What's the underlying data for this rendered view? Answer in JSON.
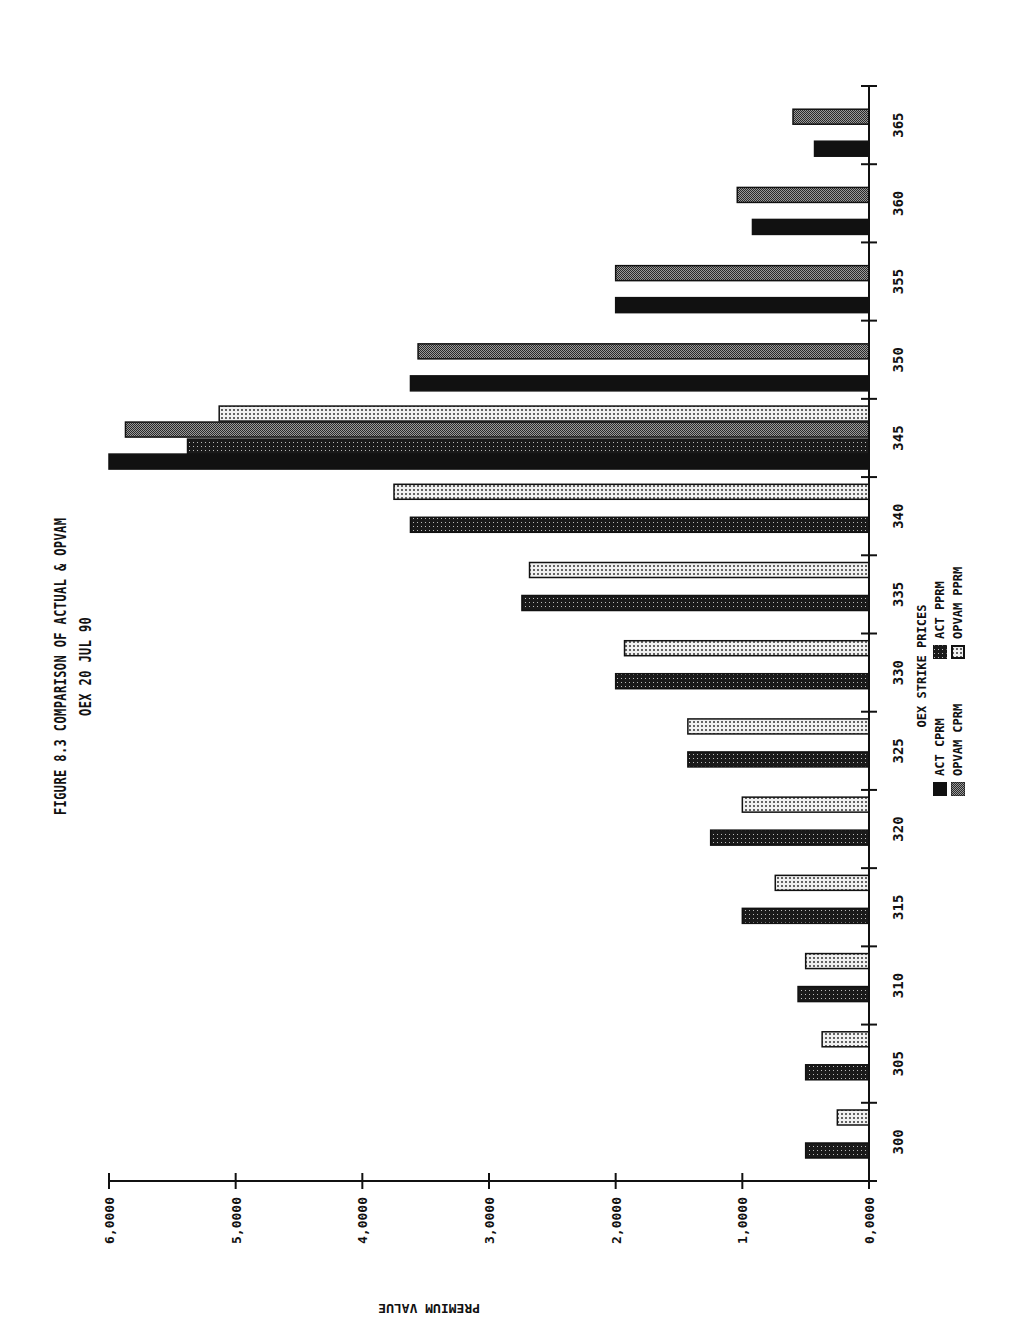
{
  "figure": {
    "title": "FIGURE 8.3 COMPARISON OF ACTUAL & OPVAM",
    "subtitle": "OEX 20 JUL 90"
  },
  "axes": {
    "ylabel": "PREMIUM VALUE",
    "xlabel": "OEX STRIKE PRICES"
  },
  "legend": {
    "title": "OEX STRIKE PRICES",
    "items": [
      {
        "label": "ACT CPRM",
        "pattern": "solid"
      },
      {
        "label": "ACT PPRM",
        "pattern": "dark-dots"
      },
      {
        "label": "OPVAM CPRM",
        "pattern": "gray-check"
      },
      {
        "label": "OPVAM PPRM",
        "pattern": "light-dots"
      }
    ]
  },
  "chart_data": {
    "type": "bar",
    "orientation": "vertical bars, page rotated 90 degrees",
    "title": "FIGURE 8.3 COMPARISON OF ACTUAL & OPVAM",
    "subtitle": "OEX 20 JUL 90",
    "xlabel": "OEX STRIKE PRICES",
    "ylabel": "PREMIUM VALUE",
    "ylim": [
      0,
      6
    ],
    "yticks": [
      0,
      1,
      2,
      3,
      4,
      5,
      6
    ],
    "ytick_labels": [
      "0,0000",
      "1,0000",
      "2,0000",
      "3,0000",
      "4,0000",
      "5,0000",
      "6,0000"
    ],
    "categories": [
      "300",
      "305",
      "310",
      "315",
      "320",
      "325",
      "330",
      "335",
      "340",
      "345",
      "350",
      "355",
      "360",
      "365"
    ],
    "series": [
      {
        "name": "ACT CPRM",
        "pattern": "solid",
        "values": [
          null,
          null,
          null,
          null,
          null,
          null,
          null,
          null,
          null,
          6.0,
          3.62,
          2.0,
          0.92,
          0.43
        ]
      },
      {
        "name": "ACT PPRM",
        "pattern": "dark-dots",
        "values": [
          0.5,
          0.5,
          0.56,
          1.0,
          1.25,
          1.43,
          2.0,
          2.74,
          3.62,
          5.38,
          null,
          null,
          null,
          null
        ]
      },
      {
        "name": "OPVAM CPRM",
        "pattern": "gray-check",
        "values": [
          null,
          null,
          null,
          null,
          null,
          null,
          null,
          null,
          null,
          5.87,
          3.56,
          2.0,
          1.04,
          0.6
        ]
      },
      {
        "name": "OPVAM PPRM",
        "pattern": "light-dots",
        "values": [
          0.25,
          0.37,
          0.5,
          0.74,
          1.0,
          1.43,
          1.93,
          2.68,
          3.75,
          5.13,
          null,
          null,
          null,
          null
        ]
      }
    ],
    "grid": false,
    "legend_position": "bottom-center"
  }
}
